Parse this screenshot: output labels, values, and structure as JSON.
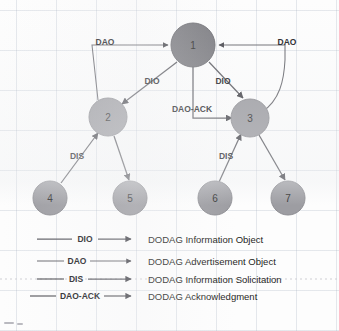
{
  "figure": {
    "type": "network-topology-diagram",
    "background": "#fdfdfd",
    "grid": true
  },
  "colors": {
    "root_node_fill": "#7b7b80",
    "node_fill": "#9d9da2",
    "edge": "#5d5d63",
    "text": "#222226"
  },
  "nodes": [
    {
      "id": "1",
      "label": "1",
      "x": 193,
      "y": 45,
      "r": 22,
      "role": "root"
    },
    {
      "id": "2",
      "label": "2",
      "x": 108,
      "y": 117,
      "r": 19,
      "role": "router"
    },
    {
      "id": "3",
      "label": "3",
      "x": 250,
      "y": 118,
      "r": 19,
      "role": "router"
    },
    {
      "id": "4",
      "label": "4",
      "x": 50,
      "y": 198,
      "r": 17,
      "role": "leaf"
    },
    {
      "id": "5",
      "label": "5",
      "x": 130,
      "y": 198,
      "r": 17,
      "role": "leaf"
    },
    {
      "id": "6",
      "label": "6",
      "x": 215,
      "y": 198,
      "r": 17,
      "role": "leaf"
    },
    {
      "id": "7",
      "label": "7",
      "x": 288,
      "y": 198,
      "r": 17,
      "role": "leaf"
    }
  ],
  "edges": [
    {
      "id": "e-2-1-dao",
      "from": "2",
      "to": "1",
      "label": "DAO",
      "label_x": 105,
      "label_y": 45
    },
    {
      "id": "e-3-1-dao",
      "from": "3",
      "to": "1",
      "label": "DAO",
      "label_x": 287,
      "label_y": 45
    },
    {
      "id": "e-1-2-dio",
      "from": "1",
      "to": "2",
      "label": "DIO",
      "label_x": 152,
      "label_y": 84
    },
    {
      "id": "e-1-3-dio",
      "from": "1",
      "to": "3",
      "label": "DIO",
      "label_x": 223,
      "label_y": 84
    },
    {
      "id": "e-1-3-daoack",
      "from": "1",
      "to": "3",
      "label": "DAO-ACK",
      "label_x": 192,
      "label_y": 112
    },
    {
      "id": "e-4-2-dis",
      "from": "4",
      "to": "2",
      "label": "DIS",
      "label_x": 77,
      "label_y": 159
    },
    {
      "id": "e-6-3-dis",
      "from": "6",
      "to": "3",
      "label": "DIS",
      "label_x": 226,
      "label_y": 159
    },
    {
      "id": "e-2-5-dio",
      "from": "2",
      "to": "5",
      "label": "",
      "label_x": 0,
      "label_y": 0
    },
    {
      "id": "e-3-7-dio",
      "from": "3",
      "to": "7",
      "label": "",
      "label_x": 0,
      "label_y": 0
    }
  ],
  "legend": {
    "items": [
      {
        "id": "legend-dio",
        "code": "DIO",
        "description": "DODAG Information Object"
      },
      {
        "id": "legend-dao",
        "code": "DAO",
        "description": "DODAG Advertisement Object"
      },
      {
        "id": "legend-dis",
        "code": "DIS",
        "description": "DODAG Information Solicitation"
      },
      {
        "id": "legend-dao-ack",
        "code": "DAO-ACK",
        "description": "DODAG  Acknowledgment"
      }
    ]
  }
}
